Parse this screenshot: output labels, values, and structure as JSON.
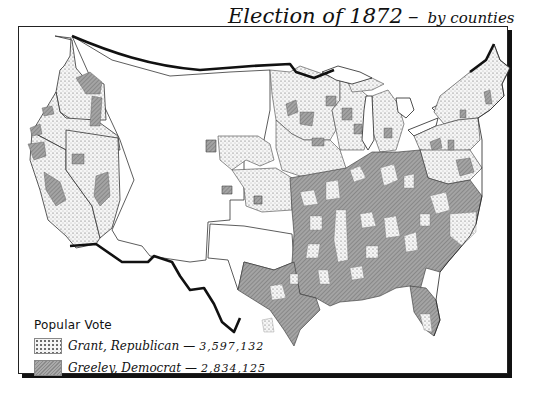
{
  "map": {
    "title": "Election of 1872",
    "title_separator": "–",
    "subtitle": "by counties",
    "region": "United States",
    "legend": {
      "heading": "Popular Vote",
      "items": [
        {
          "candidate": "Grant, Republican",
          "votes": "3,597,132",
          "pattern": "dotted",
          "color": "#f4f4f4"
        },
        {
          "candidate": "Greeley, Democrat",
          "votes": "2,834,125",
          "pattern": "hatched",
          "color": "#9a9a9a"
        }
      ]
    },
    "colors": {
      "border": "#111111",
      "grant_fill": "#f4f4f4",
      "greeley_fill": "#9a9a9a",
      "unorganized_territory": "#ffffff"
    }
  }
}
